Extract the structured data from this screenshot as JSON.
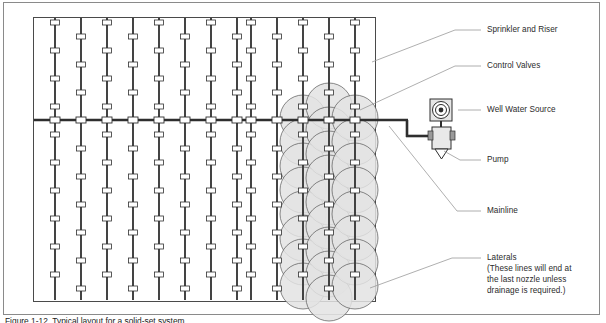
{
  "figure": {
    "caption": "Figure 1-12. Typical layout for a solid-set system."
  },
  "colors": {
    "pipe": "#3a3a3a",
    "mainline": "#2e2e2e",
    "fitting_fill": "#ffffff",
    "fitting_stroke": "#303030",
    "field_border": "#4a4a4a",
    "page_border": "#8a8a8a",
    "leader": "#9a9a9a",
    "pattern_fill": "#e3e3e3",
    "pattern_stroke": "#555555",
    "text": "#2b2b2b"
  },
  "labels": [
    {
      "id": "sprinkler-and-riser",
      "text": "Sprinkler and Riser",
      "x": 487,
      "y": 30,
      "leader": {
        "x1": 455,
        "y1": 34,
        "x2": 372,
        "y2": 62
      }
    },
    {
      "id": "control-valves",
      "text": "Control Valves",
      "x": 487,
      "y": 66,
      "leader": {
        "x1": 455,
        "y1": 70,
        "x2": 362,
        "y2": 108
      }
    },
    {
      "id": "well-water-source",
      "text": "Well Water Source",
      "x": 487,
      "y": 110,
      "leader": {
        "x1": 455,
        "y1": 114,
        "x2": 452,
        "y2": 110
      }
    },
    {
      "id": "pump",
      "text": "Pump",
      "x": 487,
      "y": 160,
      "leader": {
        "x1": 455,
        "y1": 164,
        "x2": 443,
        "y2": 150
      }
    },
    {
      "id": "mainline",
      "text": "Mainline",
      "x": 487,
      "y": 211,
      "leader": {
        "x1": 455,
        "y1": 215,
        "x2": 383,
        "y2": 124
      }
    },
    {
      "id": "laterals",
      "text": "Laterals",
      "x": 487,
      "y": 258,
      "leader": {
        "x1": 455,
        "y1": 261,
        "x2": 370,
        "y2": 285
      }
    }
  ],
  "laterals_note": {
    "line1": "(These lines will end at",
    "line2": "the last nozzle unless",
    "line3": "drainage is required.)",
    "x": 487,
    "y": 269
  },
  "field": {
    "x": 33,
    "y": 17,
    "width": 343,
    "height": 285,
    "lateral_count": 13,
    "mainline_y": 120
  },
  "equipment": {
    "well_source": {
      "label": "Well Water Source",
      "x": 430,
      "y": 99,
      "size": 22
    },
    "pump": {
      "label": "Pump",
      "x": 432,
      "y": 125,
      "width": 20,
      "height": 25
    }
  },
  "legend_items": [
    "Sprinkler and Riser",
    "Control Valves",
    "Well Water Source",
    "Pump",
    "Mainline",
    "Laterals"
  ]
}
